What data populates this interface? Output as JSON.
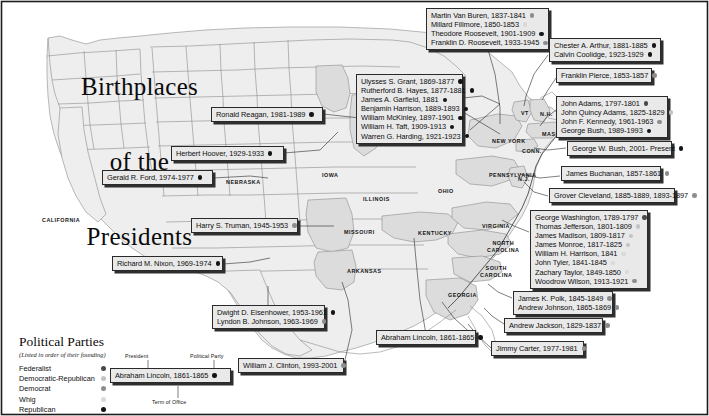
{
  "title": {
    "line1": "Birthplaces",
    "line2": "of the",
    "line3": "Presidents"
  },
  "parties": {
    "legend_title": "Political Parties",
    "legend_subtitle": "(Listed in order of their founding)",
    "items": [
      {
        "label": "Federalist",
        "key": "federalist",
        "color": "#4a4a4a"
      },
      {
        "label": "Democratic-Republican",
        "key": "demrep",
        "color": "#c3c3c3"
      },
      {
        "label": "Democrat",
        "key": "democrat",
        "color": "#8d8d8d"
      },
      {
        "label": "Whig",
        "key": "whig",
        "color": "#d9d9d9"
      },
      {
        "label": "Republican",
        "key": "republican",
        "color": "#141414"
      }
    ]
  },
  "key_diagram": {
    "president_label": "President",
    "party_label": "Political Party",
    "term_label": "Term of Office",
    "sample": "Abraham Lincoln, 1861-1865"
  },
  "state_labels": [
    {
      "name": "CALIFORNIA",
      "x": 42,
      "y": 217,
      "size": "sm"
    },
    {
      "name": "NEBRASKA",
      "x": 226,
      "y": 179,
      "size": "sm"
    },
    {
      "name": "IOWA",
      "x": 322,
      "y": 172,
      "size": "sm"
    },
    {
      "name": "ILLINOIS",
      "x": 363,
      "y": 196,
      "size": "sm"
    },
    {
      "name": "MISSOURI",
      "x": 344,
      "y": 229,
      "size": "sm"
    },
    {
      "name": "ARKANSAS",
      "x": 347,
      "y": 268,
      "size": "sm"
    },
    {
      "name": "TEXAS",
      "x": 277,
      "y": 304,
      "size": "sm"
    },
    {
      "name": "OHIO",
      "x": 438,
      "y": 188,
      "size": "sm"
    },
    {
      "name": "KENTUCKY",
      "x": 418,
      "y": 230,
      "size": "sm"
    },
    {
      "name": "PENNSYLVANIA",
      "x": 489,
      "y": 172,
      "size": "sm"
    },
    {
      "name": "NEW YORK",
      "x": 492,
      "y": 138,
      "size": "sm"
    },
    {
      "name": "VIRGINIA",
      "x": 482,
      "y": 223,
      "size": "sm"
    },
    {
      "name": "NORTH\nCAROLINA",
      "x": 487,
      "y": 240,
      "size": "sm"
    },
    {
      "name": "SOUTH\nCAROLINA",
      "x": 480,
      "y": 265,
      "size": "sm"
    },
    {
      "name": "GEORGIA",
      "x": 448,
      "y": 292,
      "size": "sm"
    },
    {
      "name": "VT",
      "x": 521,
      "y": 110,
      "size": "sm"
    },
    {
      "name": "N.H.",
      "x": 540,
      "y": 111,
      "size": "sm"
    },
    {
      "name": "MASS.",
      "x": 542,
      "y": 131,
      "size": "sm"
    },
    {
      "name": "CONN.",
      "x": 522,
      "y": 148,
      "size": "sm"
    },
    {
      "name": "N.J.",
      "x": 518,
      "y": 176,
      "size": "sm"
    }
  ],
  "callouts": [
    {
      "id": "new-york",
      "x": 426,
      "y": 8,
      "w": 123,
      "entries": [
        {
          "name": "Martin Van Buren, 1837-1841",
          "party": "democrat"
        },
        {
          "name": "Millard Fillmore, 1850-1853",
          "party": "whig"
        },
        {
          "name": "Theodore Roosevelt, 1901-1909",
          "party": "republican"
        },
        {
          "name": "Franklin D. Roosevelt, 1933-1945",
          "party": "democrat"
        }
      ]
    },
    {
      "id": "vermont",
      "x": 549,
      "y": 38,
      "w": 112,
      "entries": [
        {
          "name": "Chester A. Arthur, 1881-1885",
          "party": "republican"
        },
        {
          "name": "Calvin Coolidge, 1923-1929",
          "party": "republican"
        }
      ]
    },
    {
      "id": "new-hampshire",
      "x": 556,
      "y": 68,
      "w": 96,
      "entries": [
        {
          "name": "Franklin Pierce, 1853-1857",
          "party": "democrat"
        }
      ]
    },
    {
      "id": "ohio",
      "x": 356,
      "y": 74,
      "w": 107,
      "entries": [
        {
          "name": "Ulysses S. Grant, 1869-1877",
          "party": "republican"
        },
        {
          "name": "Rutherford B. Hayes, 1877-1881",
          "party": "republican"
        },
        {
          "name": "James A. Garfield, 1881",
          "party": "republican"
        },
        {
          "name": "Benjamin Harrison, 1889-1893",
          "party": "republican"
        },
        {
          "name": "William McKinley, 1897-1901",
          "party": "republican"
        },
        {
          "name": "William H. Taft, 1909-1913",
          "party": "republican"
        },
        {
          "name": "Warren G. Harding, 1921-1923",
          "party": "republican"
        }
      ]
    },
    {
      "id": "massachusetts",
      "x": 556,
      "y": 96,
      "w": 112,
      "entries": [
        {
          "name": "John Adams, 1797-1801",
          "party": "federalist"
        },
        {
          "name": "John Quincy Adams, 1825-1829",
          "party": "demrep"
        },
        {
          "name": "John F. Kennedy, 1961-1963",
          "party": "democrat"
        },
        {
          "name": "George Bush, 1989-1993",
          "party": "republican"
        }
      ]
    },
    {
      "id": "illinois-reagan",
      "x": 211,
      "y": 107,
      "w": 112,
      "entries": [
        {
          "name": "Ronald Reagan, 1981-1989",
          "party": "republican"
        }
      ]
    },
    {
      "id": "iowa-hoover",
      "x": 171,
      "y": 146,
      "w": 113,
      "entries": [
        {
          "name": "Herbert Hoover, 1929-1933",
          "party": "republican"
        }
      ]
    },
    {
      "id": "connecticut",
      "x": 567,
      "y": 141,
      "w": 105,
      "entries": [
        {
          "name": "George W. Bush, 2001- Present",
          "party": "republican"
        }
      ]
    },
    {
      "id": "nebraska-ford",
      "x": 102,
      "y": 170,
      "w": 111,
      "entries": [
        {
          "name": "Gerald R. Ford, 1974-1977",
          "party": "republican"
        }
      ]
    },
    {
      "id": "pennsylvania",
      "x": 561,
      "y": 166,
      "w": 100,
      "entries": [
        {
          "name": "James Buchanan, 1857-1861",
          "party": "democrat"
        }
      ]
    },
    {
      "id": "new-jersey",
      "x": 549,
      "y": 188,
      "w": 126,
      "entries": [
        {
          "name": "Grover Cleveland, 1885-1889, 1893-1897",
          "party": "democrat"
        }
      ]
    },
    {
      "id": "missouri-truman",
      "x": 191,
      "y": 218,
      "w": 107,
      "entries": [
        {
          "name": "Harry S. Truman, 1945-1953",
          "party": "democrat"
        }
      ]
    },
    {
      "id": "virginia",
      "x": 530,
      "y": 210,
      "w": 118,
      "entries": [
        {
          "name": "George Washington, 1789-1797",
          "party": "federalist"
        },
        {
          "name": "Thomas Jefferson, 1801-1809",
          "party": "demrep"
        },
        {
          "name": "James Madison, 1809-1817",
          "party": "demrep"
        },
        {
          "name": "James Monroe, 1817-1825",
          "party": "demrep"
        },
        {
          "name": "William H. Harrison, 1841",
          "party": "whig"
        },
        {
          "name": "John Tyler, 1841-1845",
          "party": "whig"
        },
        {
          "name": "Zachary Taylor, 1849-1850",
          "party": "whig"
        },
        {
          "name": "Woodrow Wilson, 1913-1921",
          "party": "democrat"
        }
      ]
    },
    {
      "id": "california-nixon",
      "x": 112,
      "y": 256,
      "w": 111,
      "entries": [
        {
          "name": "Richard M. Nixon, 1969-1974",
          "party": "republican"
        }
      ]
    },
    {
      "id": "north-carolina",
      "x": 513,
      "y": 291,
      "w": 100,
      "entries": [
        {
          "name": "James K. Polk, 1845-1849",
          "party": "democrat"
        },
        {
          "name": "Andrew Johnson, 1865-1869",
          "party": "democrat"
        }
      ]
    },
    {
      "id": "texas",
      "x": 212,
      "y": 305,
      "w": 113,
      "entries": [
        {
          "name": "Dwight D. Eisenhower, 1953-1961",
          "party": "republican"
        },
        {
          "name": "Lyndon B. Johnson, 1963-1969",
          "party": "democrat"
        }
      ]
    },
    {
      "id": "south-carolina",
      "x": 504,
      "y": 318,
      "w": 99,
      "entries": [
        {
          "name": "Andrew Jackson, 1829-1837",
          "party": "democrat"
        }
      ]
    },
    {
      "id": "kentucky-lincoln",
      "x": 376,
      "y": 330,
      "w": 100,
      "entries": [
        {
          "name": "Abraham Lincoln, 1861-1865",
          "party": "republican"
        }
      ]
    },
    {
      "id": "georgia",
      "x": 491,
      "y": 341,
      "w": 93,
      "entries": [
        {
          "name": "Jimmy Carter, 1977-1981",
          "party": "democrat"
        }
      ]
    },
    {
      "id": "arkansas-clinton",
      "x": 238,
      "y": 358,
      "w": 106,
      "entries": [
        {
          "name": "William J. Clinton, 1993-2001",
          "party": "democrat"
        }
      ]
    }
  ]
}
